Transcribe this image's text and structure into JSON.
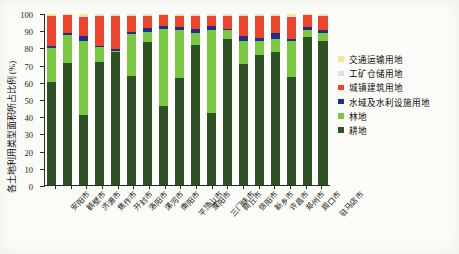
{
  "chart_data": {
    "type": "bar",
    "subtype": "stacked-percentage",
    "title": "",
    "xlabel": "",
    "ylabel": "各土地利用类型面积所占比例 (%)",
    "ylim": [
      0,
      100
    ],
    "yticks": [
      0,
      10,
      20,
      30,
      40,
      50,
      60,
      70,
      80,
      90,
      100
    ],
    "grid": false,
    "legend_position": "right",
    "categories": [
      "安阳市",
      "鹤壁市",
      "济源市",
      "焦作市",
      "开封市",
      "洛阳市",
      "漯河市",
      "南阳市",
      "平顶山市",
      "濮阳市",
      "三门峡市",
      "商丘市",
      "信阳市",
      "新乡市",
      "许昌市",
      "郑州市",
      "周口市",
      "驻马店市"
    ],
    "series": [
      {
        "name": "耕地",
        "color": "#2f5225",
        "values": [
          60.0,
          71.2,
          41.0,
          72.0,
          77.5,
          64.0,
          83.8,
          46.0,
          62.3,
          82.0,
          42.0,
          85.5,
          70.5,
          76.0,
          78.0,
          63.0,
          86.5,
          84.0
        ]
      },
      {
        "name": "林地",
        "color": "#7ac943",
        "values": [
          20.3,
          16.6,
          43.2,
          8.6,
          0.8,
          24.5,
          5.4,
          45.3,
          28.2,
          7.0,
          48.4,
          5.0,
          14.0,
          8.5,
          7.5,
          21.0,
          4.2,
          5.0
        ]
      },
      {
        "name": "水域及水利设施用地",
        "color": "#1f2f8f",
        "values": [
          1.2,
          1.0,
          3.1,
          0.9,
          1.0,
          1.2,
          2.6,
          1.4,
          2.0,
          2.0,
          2.4,
          1.0,
          2.5,
          1.6,
          3.6,
          1.2,
          1.5,
          1.6
        ]
      },
      {
        "name": "城镇建筑用地",
        "color": "#f0442a",
        "values": [
          17.2,
          10.4,
          10.8,
          17.5,
          19.8,
          9.3,
          7.2,
          6.5,
          6.3,
          8.0,
          6.2,
          7.5,
          11.8,
          13.0,
          9.9,
          13.0,
          7.0,
          8.4
        ]
      },
      {
        "name": "工矿仓储用地",
        "color": "#cfe6f2",
        "values": [
          0.4,
          0.3,
          0.6,
          0.3,
          0.3,
          0.4,
          0.3,
          0.4,
          0.5,
          0.4,
          0.5,
          0.3,
          0.4,
          0.3,
          0.3,
          0.4,
          0.3,
          0.3
        ]
      },
      {
        "name": "交通运输用地",
        "color": "#f5e49b",
        "values": [
          0.9,
          0.5,
          1.3,
          0.7,
          0.6,
          0.6,
          0.7,
          0.4,
          0.7,
          0.6,
          0.5,
          0.7,
          0.8,
          0.6,
          0.7,
          1.4,
          0.5,
          0.7
        ]
      }
    ],
    "legend_order": [
      "交通运输用地",
      "工矿仓储用地",
      "城镇建筑用地",
      "水域及水利设施用地",
      "林地",
      "耕地"
    ]
  }
}
